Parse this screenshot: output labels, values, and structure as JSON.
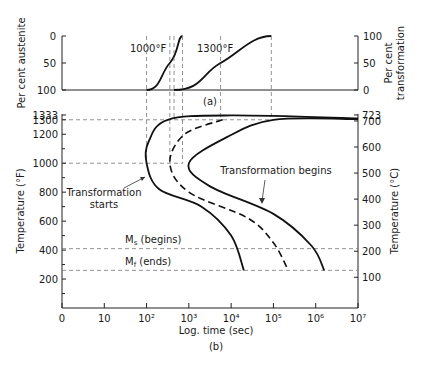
{
  "chart_data": [
    {
      "type": "line",
      "panel_label": "(a)",
      "ylabel_left": "Per cent austenite",
      "ylabel_right": "Per cent transformation",
      "yticks_left": [
        "0",
        "50",
        "100"
      ],
      "yticks_right": [
        "100",
        "50",
        "0"
      ],
      "ylim": [
        0,
        100
      ],
      "x_scale": "log time (shared with panel b)",
      "series": [
        {
          "name": "1000°F",
          "label": "1000°F",
          "points": [
            {
              "log_time": 2.0,
              "pct_transformation": 0
            },
            {
              "log_time": 2.55,
              "pct_transformation": 50
            },
            {
              "log_time": 2.85,
              "pct_transformation": 100
            }
          ]
        },
        {
          "name": "1300°F",
          "label": "1300°F",
          "points": [
            {
              "log_time": 2.65,
              "pct_transformation": 0
            },
            {
              "log_time": 3.75,
              "pct_transformation": 50
            },
            {
              "log_time": 4.95,
              "pct_transformation": 100
            }
          ]
        }
      ]
    },
    {
      "type": "line",
      "panel_label": "(b)",
      "xlabel": "Log. time (sec)",
      "ylabel_left": "Temperature (°F)",
      "ylabel_right": "Temperature (°C)",
      "xticks": [
        "0",
        "10",
        "10²",
        "10³",
        "10⁴",
        "10⁵",
        "10⁶",
        "10⁷"
      ],
      "xlim_log": [
        0,
        7
      ],
      "yticks_left": [
        "1333",
        "1300",
        "1200",
        "1000",
        "800",
        "600",
        "400",
        "200"
      ],
      "yticks_left_values": [
        1333,
        1300,
        1200,
        1000,
        800,
        600,
        400,
        200
      ],
      "yticks_right": [
        "723",
        "700",
        "600",
        "500",
        "400",
        "300",
        "200",
        "100"
      ],
      "yticks_right_values_c": [
        723,
        700,
        600,
        500,
        400,
        300,
        200,
        100
      ],
      "ylim_f": [
        0,
        1333
      ],
      "reference_lines": [
        {
          "name": "A1",
          "temp_f": 1333
        },
        {
          "name": "1300°F",
          "temp_f": 1300
        },
        {
          "name": "1000°F",
          "temp_f": 1000
        },
        {
          "name": "Ms",
          "temp_f": 410,
          "label": "Ms (begins)"
        },
        {
          "name": "Mf",
          "temp_f": 260,
          "label": "Mf (ends)"
        }
      ],
      "annotations": [
        {
          "text": "Transformation starts",
          "points_to": "start-curve"
        },
        {
          "text": "Transformation begins",
          "points_to": "end-curve"
        }
      ],
      "series": [
        {
          "name": "start-curve",
          "style": "solid",
          "points": [
            {
              "log_time": 7.0,
              "temp_f": 1310
            },
            {
              "log_time": 4.0,
              "temp_f": 1330
            },
            {
              "log_time": 2.5,
              "temp_f": 1300
            },
            {
              "log_time": 2.05,
              "temp_f": 1150
            },
            {
              "log_time": 2.0,
              "temp_f": 1000
            },
            {
              "log_time": 2.3,
              "temp_f": 820
            },
            {
              "log_time": 3.3,
              "temp_f": 700
            },
            {
              "log_time": 4.0,
              "temp_f": 500
            },
            {
              "log_time": 4.3,
              "temp_f": 260
            }
          ]
        },
        {
          "name": "mid-curve",
          "style": "dashed",
          "points": [
            {
              "log_time": 3.8,
              "temp_f": 1300
            },
            {
              "log_time": 2.9,
              "temp_f": 1200
            },
            {
              "log_time": 2.55,
              "temp_f": 1000
            },
            {
              "log_time": 3.0,
              "temp_f": 800
            },
            {
              "log_time": 4.4,
              "temp_f": 620
            },
            {
              "log_time": 5.0,
              "temp_f": 450
            },
            {
              "log_time": 5.35,
              "temp_f": 260
            }
          ]
        },
        {
          "name": "end-curve",
          "style": "solid",
          "points": [
            {
              "log_time": 7.0,
              "temp_f": 1305
            },
            {
              "log_time": 5.0,
              "temp_f": 1300
            },
            {
              "log_time": 3.9,
              "temp_f": 1180
            },
            {
              "log_time": 3.0,
              "temp_f": 1000
            },
            {
              "log_time": 3.5,
              "temp_f": 840
            },
            {
              "log_time": 5.0,
              "temp_f": 650
            },
            {
              "log_time": 5.9,
              "temp_f": 430
            },
            {
              "log_time": 6.2,
              "temp_f": 260
            }
          ]
        }
      ]
    }
  ]
}
